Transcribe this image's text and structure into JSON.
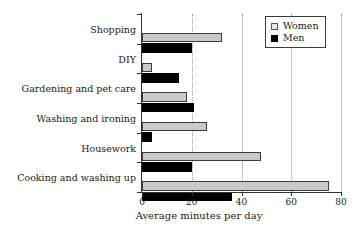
{
  "chart_data": {
    "type": "bar",
    "orientation": "horizontal",
    "title": "",
    "xlabel": "Average minutes per day",
    "ylabel": "",
    "xlim": [
      0,
      80
    ],
    "xticks": [
      0,
      20,
      40,
      60,
      80
    ],
    "xtick_labels": [
      "0",
      "20",
      "40",
      "60",
      "80"
    ],
    "grid": "vertical-dotted",
    "legend_position": "top-right",
    "categories": [
      "Shopping",
      "DIY",
      "Gardening and pet care",
      "Washing and ironing",
      "Housework",
      "Cooking and washing up"
    ],
    "series": [
      {
        "name": "Women",
        "color": "#c9c9c9",
        "values": [
          32,
          4,
          18,
          26,
          48,
          75
        ]
      },
      {
        "name": "Men",
        "color": "#000000",
        "values": [
          20,
          15,
          21,
          4,
          20,
          36
        ]
      }
    ]
  },
  "legend": {
    "items": [
      {
        "label": "Women",
        "swatch": "square-light-gray"
      },
      {
        "label": "Men",
        "swatch": "square-black"
      }
    ]
  },
  "axis": {
    "x_title": "Average minutes per day"
  }
}
